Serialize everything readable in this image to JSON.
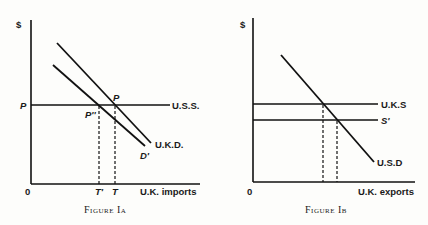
{
  "figures": [
    {
      "caption": "Figure Ia",
      "y_axis_label": "$",
      "x_axis_label": "U.K. imports",
      "origin_label": "0",
      "price_label": "P",
      "supply_label": "U.S.S.",
      "demand_label": "U.K.D.",
      "demand_shifted_label": "D'",
      "intersection_label": "P",
      "intersection_shifted_label": "P''",
      "quantity_label": "T",
      "quantity_shifted_label": "T'"
    },
    {
      "caption": "Figure Ib",
      "y_axis_label": "$",
      "x_axis_label": "U.K. exports",
      "origin_label": "0",
      "supply_label": "U.K.S",
      "supply_shifted_label": "S'",
      "demand_label": "U.S.D"
    }
  ]
}
